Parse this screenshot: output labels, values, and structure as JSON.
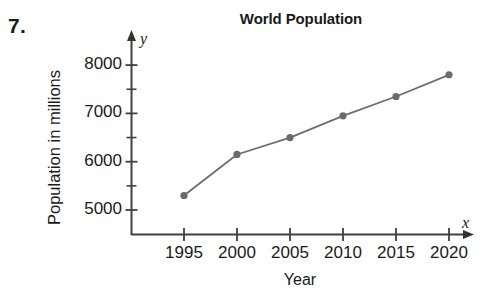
{
  "problem": {
    "number": "7."
  },
  "chart_data": {
    "type": "line",
    "title": "World Population",
    "xlabel": "Year",
    "ylabel": "Population in millions",
    "x_axis_letter": "y",
    "y_axis_letter": "x",
    "categories": [
      "1995",
      "2000",
      "2005",
      "2010",
      "2015",
      "2020"
    ],
    "x": [
      1995,
      2000,
      2005,
      2010,
      2015,
      2020
    ],
    "values": [
      5300,
      6150,
      6500,
      6950,
      7350,
      7800
    ],
    "series": [
      {
        "name": "World Population",
        "values": [
          5300,
          6150,
          6500,
          6950,
          7350,
          7800
        ]
      }
    ],
    "y_tick_labels": [
      "8000",
      "7000",
      "6000",
      "5000"
    ],
    "y_ticks_major": [
      8000,
      7000,
      6000,
      5000
    ],
    "y_ticks_minor": [
      7500,
      6500,
      5500
    ],
    "xlim": [
      1992.5,
      2022.5
    ],
    "ylim": [
      4600,
      8300
    ],
    "grid": false,
    "legend": false,
    "marker": "circle",
    "line_color": "#6e6e6e",
    "marker_color": "#6b6b6b",
    "axis_color": "#333333"
  },
  "axis_letters": {
    "y": "y",
    "x": "x"
  }
}
